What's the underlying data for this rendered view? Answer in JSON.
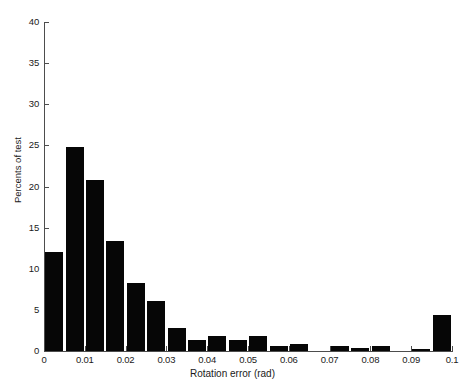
{
  "chart_data": {
    "type": "bar",
    "title": "",
    "subtitle": "",
    "xlabel": "Rotation error (rad)",
    "ylabel": "Percents of test",
    "xlim": [
      0,
      0.1
    ],
    "ylim": [
      0,
      40
    ],
    "grid": false,
    "legend": null,
    "bar_color": "#060606",
    "axis_color": "#4d4d4d",
    "background": "#ffffff",
    "bin_width": 0.005,
    "xticks": [
      0,
      0.01,
      0.02,
      0.03,
      0.04,
      0.05,
      0.06,
      0.07,
      0.08,
      0.09,
      0.1
    ],
    "xtick_labels": [
      "0",
      "0.01",
      "0.02",
      "0.03",
      "0.04",
      "0.05",
      "0.06",
      "0.07",
      "0.08",
      "0.09",
      "0.1"
    ],
    "yticks": [
      0,
      5,
      10,
      15,
      20,
      25,
      30,
      35,
      40
    ],
    "ytick_labels": [
      "0",
      "5",
      "10",
      "15",
      "20",
      "25",
      "30",
      "35",
      "40"
    ],
    "categories": [
      0.0,
      0.005,
      0.01,
      0.015,
      0.02,
      0.025,
      0.03,
      0.035,
      0.04,
      0.045,
      0.05,
      0.055,
      0.06,
      0.065,
      0.07,
      0.075,
      0.08,
      0.085,
      0.09,
      0.095
    ],
    "values": [
      12.0,
      24.8,
      20.8,
      13.4,
      8.3,
      6.1,
      2.8,
      1.3,
      1.8,
      1.3,
      1.8,
      0.6,
      0.9,
      0.0,
      0.6,
      0.4,
      0.6,
      0.0,
      0.3,
      4.4
    ]
  }
}
